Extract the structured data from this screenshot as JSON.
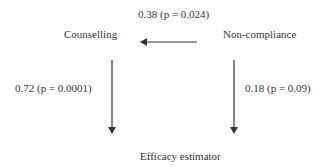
{
  "nodes": {
    "counselling": "Counselling",
    "non_compliance": "Non-compliance",
    "efficacy_estimator": "Efficacy estimator"
  },
  "edges": [
    {
      "from": "Non-compliance",
      "to": "Counselling",
      "label": "0.38 (p = 0.024)"
    },
    {
      "from": "Counselling",
      "to": "Efficacy estimator",
      "label": "0.72 (p = 0.0001)"
    },
    {
      "from": "Non-compliance",
      "to": "Efficacy estimator",
      "label": "0.18 (p = 0.09)"
    }
  ],
  "colors": {
    "line": "#333333",
    "text": "#333333",
    "background": "#ffffff"
  }
}
